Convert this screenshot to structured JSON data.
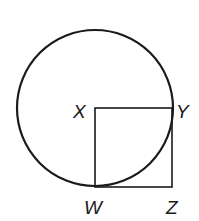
{
  "diagram": {
    "type": "geometry",
    "colors": {
      "stroke": "#1a1a1a",
      "background": "#ffffff"
    },
    "circle": {
      "center": "X"
    },
    "square": {
      "vertices": [
        "X",
        "Y",
        "Z",
        "W"
      ]
    },
    "labels": {
      "X": "X",
      "Y": "Y",
      "W": "W",
      "Z": "Z"
    }
  }
}
